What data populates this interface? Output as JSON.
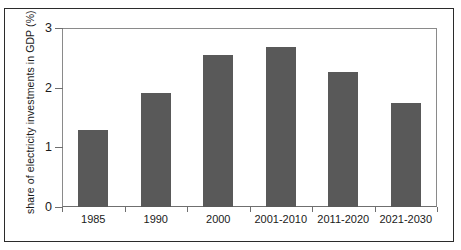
{
  "chart_data": {
    "type": "bar",
    "title": "",
    "xlabel": "",
    "ylabel": "share of electricity investments in GDP (%)",
    "categories": [
      "1985",
      "1990",
      "2000",
      "2001-2010",
      "2011-2020",
      "2021-2030"
    ],
    "values": [
      1.29,
      1.91,
      2.55,
      2.68,
      2.26,
      1.74
    ],
    "ylim": [
      0,
      3
    ],
    "yticks": [
      0,
      1,
      2,
      3
    ],
    "ytick_labels": [
      "0",
      "1",
      "2",
      "3"
    ],
    "grid": false,
    "legend": null,
    "bar_color": "#595959",
    "axis_color": "#6f6f6f",
    "frame_color": "#2b2b2b",
    "background": "#ffffff"
  }
}
